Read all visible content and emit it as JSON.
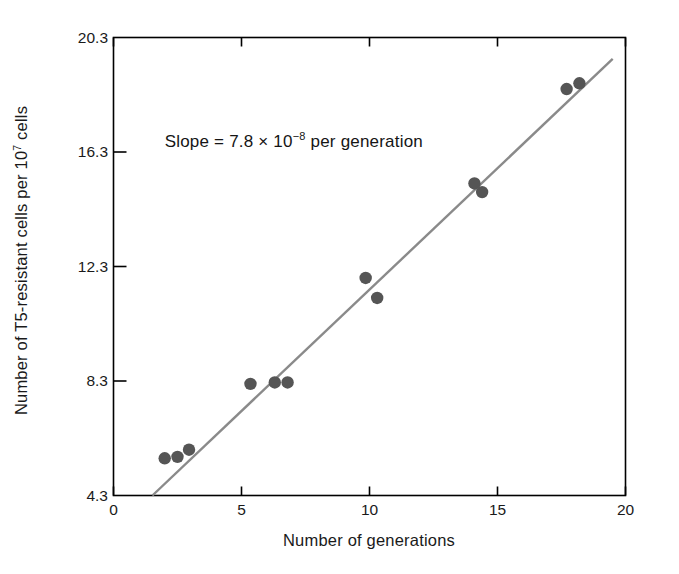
{
  "chart_data": {
    "type": "scatter",
    "title": "",
    "xlabel": "Number of generations",
    "ylabel": "Number of T5-resistant cells per 10⁷ cells",
    "ylabel_base": "Number of T5-resistant cells per 10",
    "ylabel_exponent": "7",
    "ylabel_tail": " cells",
    "xlim": [
      0,
      20
    ],
    "ylim": [
      4.3,
      20.3
    ],
    "xticks": [
      0,
      5,
      10,
      15,
      20
    ],
    "xticklabels": [
      "0",
      "5",
      "10",
      "15",
      "20"
    ],
    "yticks": [
      4.3,
      8.3,
      12.3,
      16.3,
      20.3
    ],
    "yticklabels": [
      "4.3",
      "8.3",
      "12.3",
      "16.3",
      "20.3"
    ],
    "grid": false,
    "legend": "none",
    "marker_color": "#555555",
    "line_color": "#8a8a8a",
    "axis_color": "#000000",
    "points": [
      {
        "x": 2.0,
        "y": 5.6
      },
      {
        "x": 2.5,
        "y": 5.65
      },
      {
        "x": 2.95,
        "y": 5.9
      },
      {
        "x": 5.35,
        "y": 8.2
      },
      {
        "x": 6.3,
        "y": 8.25
      },
      {
        "x": 6.8,
        "y": 8.25
      },
      {
        "x": 9.85,
        "y": 11.9
      },
      {
        "x": 10.3,
        "y": 11.2
      },
      {
        "x": 14.1,
        "y": 15.2
      },
      {
        "x": 14.4,
        "y": 14.9
      },
      {
        "x": 17.7,
        "y": 18.5
      },
      {
        "x": 18.2,
        "y": 18.7
      }
    ],
    "fit_line": {
      "x0": 1.52,
      "y0": 4.3,
      "x1": 19.5,
      "y1": 19.55
    },
    "annotations": [
      {
        "text": "Slope = 7.8 × 10⁻⁸ per generation",
        "prefix": "Slope = 7.8 × 10",
        "exponent": "−8",
        "suffix": " per generation",
        "x": 2.0,
        "y": 16.6
      }
    ]
  }
}
